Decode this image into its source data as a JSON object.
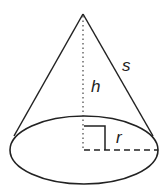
{
  "diagram": {
    "labels": {
      "height": "h",
      "slant": "s",
      "radius": "r"
    },
    "colors": {
      "stroke": "#222222",
      "background": "#ffffff"
    }
  }
}
